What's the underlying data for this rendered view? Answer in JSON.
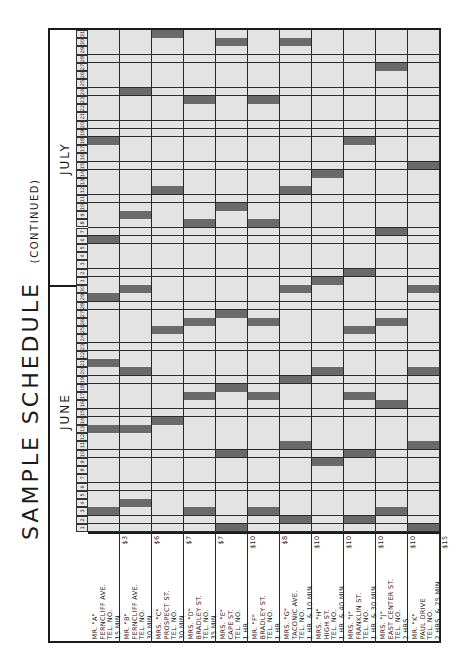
{
  "document": {
    "title": "SAMPLE   SCHEDULE",
    "subtitle": "(CONTINUED)"
  },
  "months": [
    {
      "name": "JUNE",
      "days": 30
    },
    {
      "name": "JULY",
      "days": 31
    }
  ],
  "customers": [
    {
      "id": "A",
      "lines": [
        "MR. \"A\"",
        "FERNCLIFF AVE.",
        "TEL. NO.",
        "15 MIN."
      ],
      "fee": "$3"
    },
    {
      "id": "B",
      "lines": [
        "MR. \"B\"",
        "FERNCLIFF AVE.",
        "TEL. NO.",
        "30 MIN."
      ],
      "fee": "$6"
    },
    {
      "id": "C",
      "lines": [
        "MRS. \"C\"",
        "PROSPECT ST.",
        "TEL. NO.",
        "30 MIN."
      ],
      "fee": "$7"
    },
    {
      "id": "D",
      "lines": [
        "MRS. \"D\"",
        "BRADLEY ST.",
        "TEL. NO.",
        "35 MIN."
      ],
      "fee": "$7"
    },
    {
      "id": "E",
      "lines": [
        "MRS. \"E\"",
        "CAPE ST.",
        "TEL. NO.",
        "1 HR."
      ],
      "fee": "$10"
    },
    {
      "id": "F",
      "lines": [
        "MR. \"F\"",
        "BRADLEY ST.",
        "TEL. NO.",
        "1 HR."
      ],
      "fee": "$8"
    },
    {
      "id": "G",
      "lines": [
        "MRS. \"G\"",
        "TACONIC AVE.",
        "TEL. NO.",
        "1 HR. & 10 MIN."
      ],
      "fee": "$10"
    },
    {
      "id": "H",
      "lines": [
        "MRS. \"H\"",
        "HIGH ST.",
        "TEL. NO.",
        "1 HR. & 40 MIN."
      ],
      "fee": "$10"
    },
    {
      "id": "I",
      "lines": [
        "MRS. \"I\"",
        "FRANKLIN ST.",
        "TEL. NO.",
        "1 HR. & 30 MIN."
      ],
      "fee": "$10"
    },
    {
      "id": "J",
      "lines": [
        "MRS. \"J\"",
        "EAST CENTER ST.",
        "TEL. NO.",
        "2 HRS."
      ],
      "fee": "$10"
    },
    {
      "id": "K",
      "lines": [
        "MR. \"K\"",
        "PAUL DRIVE",
        "TEL. NO.",
        "2 HRS. & 25 MIN."
      ],
      "fee": "$15"
    }
  ],
  "schedule": {
    "A": {
      "JUNE": [
        3,
        13,
        21,
        29
      ],
      "JULY": [
        6,
        18
      ]
    },
    "B": {
      "JUNE": [
        4,
        13,
        20,
        30
      ],
      "JULY": [
        9,
        24
      ]
    },
    "C": {
      "JUNE": [
        14,
        25
      ],
      "JULY": [
        12,
        31
      ]
    },
    "D": {
      "JUNE": [
        3,
        17,
        26
      ],
      "JULY": [
        8,
        23
      ]
    },
    "E": {
      "JUNE": [
        1,
        10,
        18,
        27
      ],
      "JULY": [
        10,
        30
      ]
    },
    "F": {
      "JUNE": [
        3,
        17,
        26
      ],
      "JULY": [
        8,
        23
      ]
    },
    "G": {
      "JUNE": [
        2,
        11,
        19,
        30
      ],
      "JULY": [
        12,
        30
      ]
    },
    "H": {
      "JUNE": [
        9,
        20
      ],
      "JULY": [
        1,
        14
      ]
    },
    "I": {
      "JUNE": [
        2,
        10,
        17,
        25
      ],
      "JULY": [
        2,
        18
      ]
    },
    "J": {
      "JUNE": [
        3,
        16,
        26
      ],
      "JULY": [
        7,
        27
      ]
    },
    "K": {
      "JUNE": [
        1,
        11,
        20,
        30
      ],
      "JULY": [
        15
      ]
    }
  },
  "colors": {
    "shaded": "#6a6a6a",
    "empty": "#e3e3e3",
    "line": "#2a2a2a"
  }
}
